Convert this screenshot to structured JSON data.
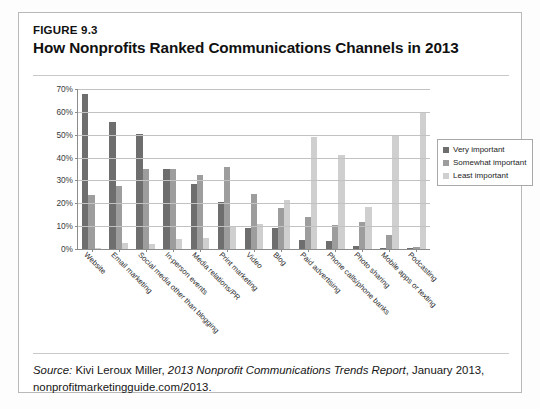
{
  "figure": {
    "number": "FIGURE 9.3",
    "title": "How Nonprofits Ranked Communications Channels in 2013"
  },
  "source": {
    "label": "Source:",
    "author": " Kivi Leroux Miller, ",
    "report": "2013 Nonprofit Communications Trends Report",
    "rest": ", January 2013, nonprofitmarketingguide.com/2013."
  },
  "legend": {
    "position": "right",
    "items": [
      {
        "label": "Very important",
        "color": "#6e6e6e"
      },
      {
        "label": "Somewhat important",
        "color": "#9d9d9d"
      },
      {
        "label": "Least important",
        "color": "#cfcfcf"
      }
    ]
  },
  "axis": {
    "yticks": [
      "0%",
      "10%",
      "20%",
      "30%",
      "40%",
      "50%",
      "60%",
      "70%"
    ]
  },
  "chart_data": {
    "type": "bar",
    "title": "How Nonprofits Ranked Communications Channels in 2013",
    "subtitle": "FIGURE 9.3",
    "xlabel": "",
    "ylabel": "",
    "ylim": [
      0,
      70
    ],
    "ytick_values": [
      0,
      10,
      20,
      30,
      40,
      50,
      60,
      70
    ],
    "ytick_labels": [
      "0%",
      "10%",
      "20%",
      "30%",
      "40%",
      "50%",
      "60%",
      "70%"
    ],
    "grid": true,
    "legend_position": "right",
    "categories": [
      "Website",
      "Email marketing",
      "Social media other than blogging",
      "In-person events",
      "Media relations/PR",
      "Print marketing",
      "Video",
      "Blog",
      "Paid advertising",
      "Phone calls/phone banks",
      "Photo sharing",
      "Mobile apps or texting",
      "Podcasting"
    ],
    "series": [
      {
        "name": "Very important",
        "color": "#6e6e6e",
        "values": [
          68,
          55.5,
          50.5,
          35,
          28.5,
          20.5,
          9,
          9,
          4,
          3.5,
          1.5,
          0.5,
          0.5
        ]
      },
      {
        "name": "Somewhat important",
        "color": "#9d9d9d",
        "values": [
          23.5,
          27.5,
          35,
          35,
          32.5,
          36,
          24,
          18,
          14,
          10.5,
          12,
          6,
          1
        ]
      },
      {
        "name": "Least important",
        "color": "#cfcfcf",
        "values": [
          0.5,
          2.5,
          2,
          4.5,
          5,
          9.5,
          11,
          21.5,
          49,
          41,
          18.5,
          49.5,
          59.5
        ]
      }
    ]
  }
}
